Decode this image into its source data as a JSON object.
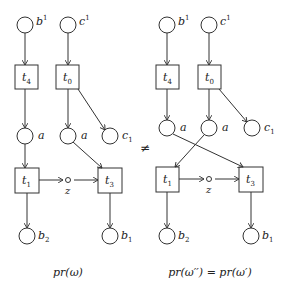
{
  "diagrams": [
    {
      "name": "left",
      "caption": "pr(ω)",
      "places": [
        {
          "id": "b1_top",
          "label": "b",
          "sup": "1",
          "cx": 25,
          "cy": 25
        },
        {
          "id": "c1_top",
          "label": "c",
          "sup": "1",
          "cx": 68,
          "cy": 25
        },
        {
          "id": "a_left",
          "label": "a",
          "cx": 25,
          "cy": 136
        },
        {
          "id": "a_right",
          "label": "a",
          "cx": 68,
          "cy": 136
        },
        {
          "id": "c_sub1",
          "label": "c",
          "sub": "1",
          "cx": 110,
          "cy": 136
        },
        {
          "id": "b_sub2",
          "label": "b",
          "sub": "2",
          "cx": 27,
          "cy": 236
        },
        {
          "id": "b_sub1",
          "label": "b",
          "sub": "1",
          "cx": 110,
          "cy": 236
        }
      ],
      "transitions": [
        {
          "id": "t4",
          "label": "t",
          "sub": "4",
          "x": 15,
          "y": 65
        },
        {
          "id": "t0",
          "label": "t",
          "sub": "0",
          "x": 56,
          "y": 65
        },
        {
          "id": "t1",
          "label": "t",
          "sub": "1",
          "x": 15,
          "y": 168
        },
        {
          "id": "t3",
          "label": "t",
          "sub": "3",
          "x": 98,
          "y": 168
        }
      ],
      "z": {
        "label": "z",
        "cx": 68,
        "cy": 180
      }
    },
    {
      "name": "right",
      "caption": "pr(ω′′) = pr(ω′)",
      "places": [
        {
          "id": "b1_top",
          "label": "b",
          "sup": "1",
          "cx": 167,
          "cy": 25
        },
        {
          "id": "c1_top",
          "label": "c",
          "sup": "1",
          "cx": 209,
          "cy": 25
        },
        {
          "id": "a_left",
          "label": "a",
          "cx": 167,
          "cy": 128
        },
        {
          "id": "a_right",
          "label": "a",
          "cx": 209,
          "cy": 128
        },
        {
          "id": "c_sub1",
          "label": "c",
          "sub": "1",
          "cx": 252,
          "cy": 128
        },
        {
          "id": "b_sub2",
          "label": "b",
          "sub": "2",
          "cx": 167,
          "cy": 236
        },
        {
          "id": "b_sub1",
          "label": "b",
          "sub": "1",
          "cx": 251,
          "cy": 236
        }
      ],
      "transitions": [
        {
          "id": "t4",
          "label": "t",
          "sub": "4",
          "x": 156,
          "y": 65
        },
        {
          "id": "t0",
          "label": "t",
          "sub": "0",
          "x": 198,
          "y": 65
        },
        {
          "id": "t1",
          "label": "t",
          "sub": "1",
          "x": 156,
          "y": 167
        },
        {
          "id": "t3",
          "label": "t",
          "sub": "3",
          "x": 239,
          "y": 167
        }
      ],
      "z": {
        "label": "z",
        "cx": 209,
        "cy": 180
      }
    }
  ],
  "relation": "≠",
  "labels": {
    "b": "b",
    "c": "c",
    "a": "a",
    "t": "t",
    "z": "z",
    "sup1": "1",
    "sub0": "0",
    "sub1": "1",
    "sub2": "2",
    "sub3": "3",
    "sub4": "4",
    "left_caption": "pr(ω)",
    "right_caption": "pr(ω′′) = pr(ω′)",
    "neq": "≠"
  },
  "colors": {
    "stroke": "#333333",
    "text": "#222222",
    "background": "#ffffff"
  }
}
